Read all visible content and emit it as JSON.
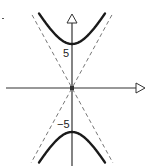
{
  "chart_data": {
    "type": "line",
    "title": "",
    "xlabel": "",
    "ylabel": "",
    "hyperbola": {
      "a": 5,
      "b": 2.74,
      "orientation": "vertical"
    },
    "asymptotes": [
      {
        "name": "asymptote-positive",
        "slope": 1.83,
        "style": "dashed"
      },
      {
        "name": "asymptote-negative",
        "slope": -1.83,
        "style": "dashed"
      }
    ],
    "series": [
      {
        "name": "upper-branch",
        "vertex": [
          0,
          5
        ]
      },
      {
        "name": "lower-branch",
        "vertex": [
          0,
          -5
        ]
      }
    ],
    "xlim": [
      -8.2,
      8.2
    ],
    "ylim": [
      -8.6,
      8.4
    ],
    "y_tick_labels": [
      {
        "value": 5,
        "label": "5"
      },
      {
        "value": -5,
        "label": "−5"
      }
    ],
    "grid": false,
    "axis_arrows": "open-triangle",
    "colors": {
      "curve": "#1a1a1a",
      "asymptote": "#777777",
      "axis": "#333333"
    }
  }
}
